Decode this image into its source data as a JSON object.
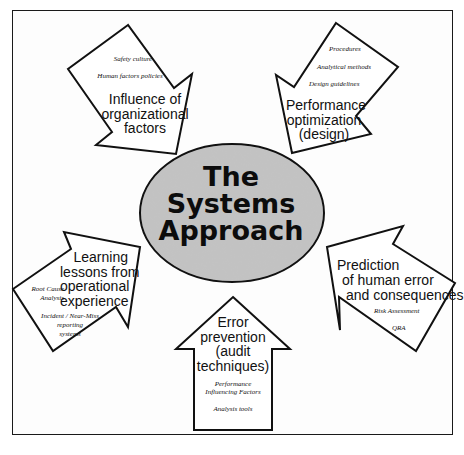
{
  "center": {
    "lines": [
      "The",
      "Systems",
      "Approach"
    ]
  },
  "arrows": {
    "organizational": {
      "title_lines": [
        "Influence of",
        "organizational",
        "factors"
      ],
      "items": [
        "Safety culture",
        "Human factors policies"
      ]
    },
    "performance": {
      "title_lines": [
        "Performance",
        "optimization",
        "(design)"
      ],
      "items": [
        "Procedures",
        "Analytical methods",
        "Design guidelines"
      ]
    },
    "learning": {
      "title_lines": [
        "Learning",
        "lessons from",
        "operational",
        "experience"
      ],
      "items": [
        "Root Cause",
        "Analysis",
        "Incident / Near-Miss",
        "reporting",
        "systems"
      ]
    },
    "prevention": {
      "title_lines": [
        "Error",
        "prevention",
        "(audit",
        "techniques)"
      ],
      "items": [
        "Performance",
        "Influencing Factors",
        "Analysis tools"
      ]
    },
    "prediction": {
      "title_lines": [
        "Prediction",
        "of human error",
        "and consequences"
      ],
      "items": [
        "Risk Assessment",
        "QRA"
      ]
    }
  },
  "colors": {
    "ellipse_fill": "#bdbdbd",
    "stroke": "#111111",
    "background": "#ffffff"
  }
}
